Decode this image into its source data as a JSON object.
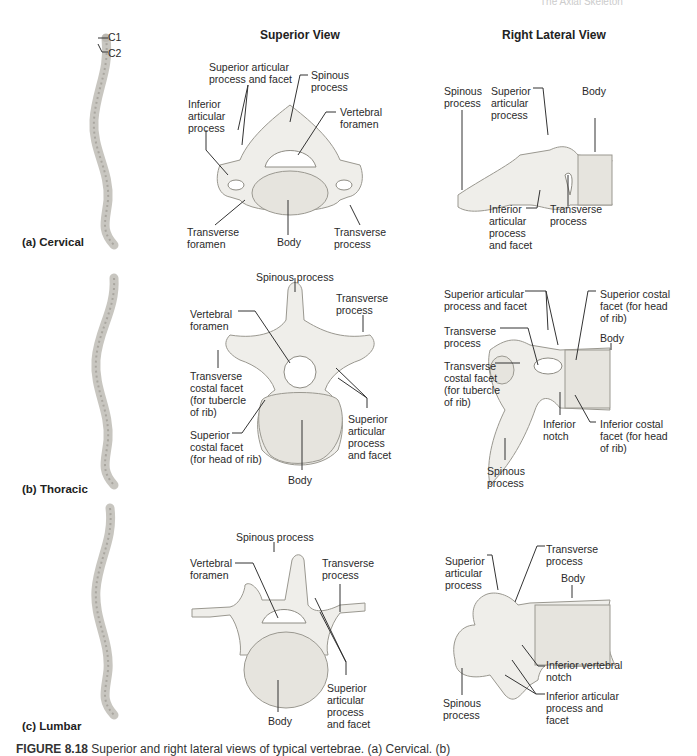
{
  "header": {
    "running_head": "The Axial Skeleton"
  },
  "columns": {
    "superior": "Superior View",
    "lateral": "Right Lateral View"
  },
  "spine_markers": {
    "c1": "C1",
    "c2": "C2"
  },
  "rows": [
    {
      "label": "(a)  Cervical",
      "superior_labels": {
        "sup_art": "Superior articular\nprocess and facet",
        "spinous": "Spinous\nprocess",
        "inf_art": "Inferior\narticular\nprocess",
        "vert_foramen": "Vertebral\nforamen",
        "trans_foramen": "Transverse\nforamen",
        "body": "Body",
        "trans_process": "Transverse\nprocess"
      },
      "lateral_labels": {
        "spinous": "Spinous\nprocess",
        "sup_art": "Superior\narticular\nprocess",
        "body": "Body",
        "inf_art": "Inferior\narticular\nprocess\nand facet",
        "trans_process": "Transverse\nprocess"
      }
    },
    {
      "label": "(b)  Thoracic",
      "superior_labels": {
        "spinous": "Spinous process",
        "trans_process": "Transverse\nprocess",
        "vert_foramen": "Vertebral\nforamen",
        "trans_costal": "Transverse\ncostal facet\n(for tubercle\nof rib)",
        "sup_art": "Superior\narticular\nprocess\nand facet",
        "sup_costal": "Superior\ncostal facet\n(for head of rib)",
        "body": "Body"
      },
      "lateral_labels": {
        "sup_art": "Superior articular\nprocess and facet",
        "sup_costal": "Superior costal\nfacet (for head\nof rib)",
        "trans_process": "Transverse\nprocess",
        "body": "Body",
        "trans_costal": "Transverse\ncostal facet\n(for tubercle\nof rib)",
        "inf_notch": "Inferior\nnotch",
        "inf_costal": "Inferior costal\nfacet (for head\nof rib)",
        "spinous": "Spinous\nprocess"
      }
    },
    {
      "label": "(c)  Lumbar",
      "superior_labels": {
        "spinous": "Spinous process",
        "vert_foramen": "Vertebral\nforamen",
        "trans_process": "Transverse\nprocess",
        "sup_art": "Superior\narticular\nprocess\nand facet",
        "body": "Body"
      },
      "lateral_labels": {
        "sup_art": "Superior\narticular\nprocess",
        "trans_process": "Transverse\nprocess",
        "body": "Body",
        "inf_vert_notch": "Inferior vertebral\nnotch",
        "inf_art": "Inferior articular\nprocess and\nfacet",
        "spinous": "Spinous\nprocess"
      }
    }
  ],
  "caption": {
    "figure_no": "FIGURE 8.18",
    "text": " Superior and right lateral views of typical vertebrae. (a) Cervical. (b)"
  }
}
